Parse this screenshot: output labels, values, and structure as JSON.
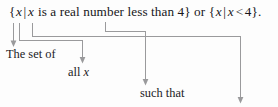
{
  "figure": {
    "kind": "annotated-math-expression",
    "line_color": "#9a9a9c",
    "text_color": "#17171a",
    "background": "#fdfdfd"
  },
  "formula": {
    "full_text": "{x|x is a real number less than 4} or {x|x < 4}.",
    "open_brace_1": "{",
    "var_1": "x",
    "bar_1": "|",
    "var_2": "x",
    "predicate": " is a real number less than 4",
    "close_brace_1": "}",
    "connector": " or ",
    "open_brace_2": "{",
    "var_3": "x",
    "bar_2": "|",
    "var_4": "x",
    "relation": "<",
    "bound": "4",
    "close_brace_2": "}",
    "period": "."
  },
  "annotations": [
    {
      "id": "the-set-of",
      "label": "The set of",
      "points_to": "open_brace_1"
    },
    {
      "id": "all-x",
      "label_prefix": "all ",
      "label_var": "x",
      "label": "all x",
      "points_to": "var_1"
    },
    {
      "id": "such-that",
      "label": "such that",
      "points_to": "bar_1"
    },
    {
      "id": "condition",
      "label": "",
      "points_to": "predicate"
    }
  ]
}
